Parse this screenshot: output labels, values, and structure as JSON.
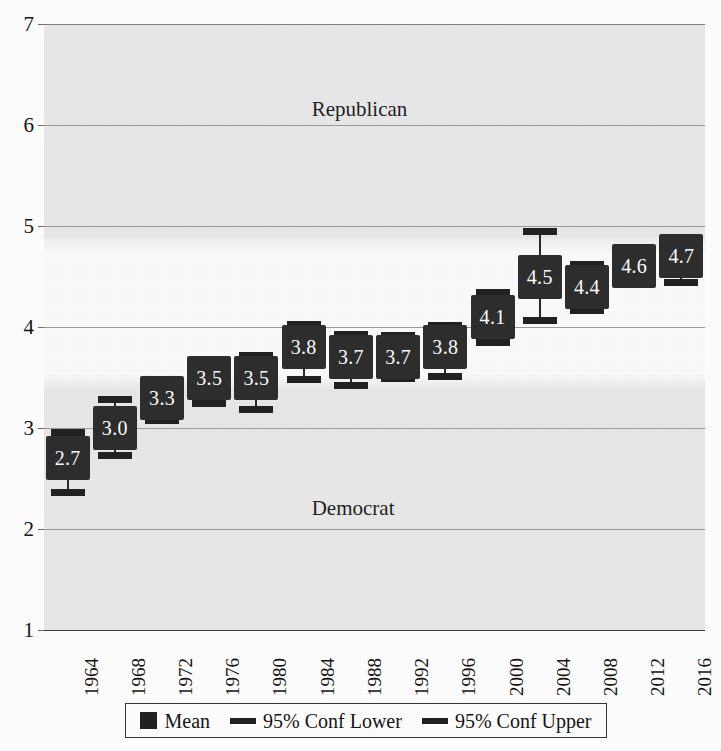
{
  "chart_data": {
    "type": "scatter",
    "title": "",
    "xlabel": "",
    "ylabel": "",
    "ylim": [
      1,
      7
    ],
    "yticks": [
      1,
      2,
      3,
      4,
      5,
      6,
      7
    ],
    "grid": true,
    "legend_position": "bottom",
    "categories": [
      "1964",
      "1968",
      "1972",
      "1976",
      "1980",
      "1984",
      "1988",
      "1992",
      "1996",
      "2000",
      "2004",
      "2008",
      "2012",
      "2016"
    ],
    "series": [
      {
        "name": "Mean",
        "values": [
          2.7,
          3.0,
          3.3,
          3.5,
          3.5,
          3.8,
          3.7,
          3.7,
          3.8,
          4.1,
          4.5,
          4.4,
          4.6,
          4.7
        ],
        "labels": [
          "2.7",
          "3.0",
          "3.3",
          "3.5",
          "3.5",
          "3.8",
          "3.7",
          "3.7",
          "3.8",
          "4.1",
          "4.5",
          "4.4",
          "4.6",
          "4.7"
        ]
      },
      {
        "name": "95% Conf Lower",
        "values": [
          2.37,
          2.73,
          3.08,
          3.25,
          3.19,
          3.49,
          3.43,
          3.5,
          3.51,
          3.85,
          4.07,
          4.17,
          4.47,
          4.45
        ]
      },
      {
        "name": "95% Conf Upper",
        "values": [
          2.96,
          3.29,
          3.48,
          3.68,
          3.72,
          4.03,
          3.93,
          3.92,
          4.02,
          4.35,
          4.95,
          4.62,
          4.72,
          4.88
        ]
      }
    ],
    "annotations": [
      {
        "text": "Republican",
        "x_frac": 0.405,
        "y": 6.15
      },
      {
        "text": "Democrat",
        "x_frac": 0.405,
        "y": 2.2
      }
    ]
  },
  "legend": {
    "items": [
      {
        "label": "Mean",
        "marker": "filled-square",
        "color": "#1e1e1e"
      },
      {
        "label": "95% Conf Lower",
        "marker": "dash",
        "color": "#1e1e1e"
      },
      {
        "label": "95% Conf Upper",
        "marker": "dash",
        "color": "#1e1e1e"
      }
    ]
  },
  "colors": {
    "marker": "#2b2b2b",
    "marker_text": "#ffffff",
    "gridline": "#9a9a9a",
    "plot_background": "#e9e9e9",
    "page_background": "#ffffff",
    "axis_text": "#111111"
  }
}
